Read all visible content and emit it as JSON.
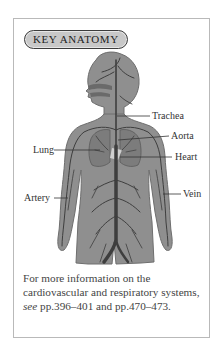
{
  "badge": {
    "label": "KEY ANATOMY"
  },
  "figure": {
    "colors": {
      "body": "#8f8f8f",
      "body_edge": "#6e6e6e",
      "vessels": "#3e3e3e",
      "lungs": "#7e7e7e",
      "heart": "#c9c9c9"
    },
    "labels": [
      {
        "id": "trachea",
        "text": "Trachea"
      },
      {
        "id": "aorta",
        "text": "Aorta"
      },
      {
        "id": "lung",
        "text": "Lung"
      },
      {
        "id": "heart",
        "text": "Heart"
      },
      {
        "id": "artery",
        "text": "Artery"
      },
      {
        "id": "vein",
        "text": "Vein"
      }
    ]
  },
  "caption": {
    "text_before": "For more information on the cardiovascular and respiratory systems, ",
    "emphasis": "see",
    "text_after": " pp.396–401 and pp.470–473."
  }
}
